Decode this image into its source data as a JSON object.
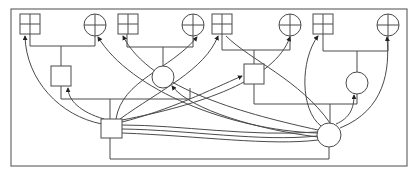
{
  "diagram": {
    "title": "",
    "colors": {
      "stroke": "#4a4a4a",
      "frame": "#6a6a6a",
      "arrow": "#222222",
      "background": "#ffffff"
    },
    "top_row": [
      {
        "id": "g1",
        "shape": "grid-square",
        "x": 22,
        "y": 14,
        "w": 20,
        "h": 20
      },
      {
        "id": "c1",
        "shape": "crossed-circle",
        "x": 95,
        "y": 25,
        "r": 11
      },
      {
        "id": "g2",
        "shape": "grid-square",
        "x": 119,
        "y": 14,
        "w": 20,
        "h": 20
      },
      {
        "id": "c2",
        "shape": "crossed-circle",
        "x": 193,
        "y": 25,
        "r": 11
      },
      {
        "id": "g3",
        "shape": "grid-square",
        "x": 212,
        "y": 14,
        "w": 20,
        "h": 20
      },
      {
        "id": "c3",
        "shape": "crossed-circle",
        "x": 290,
        "y": 25,
        "r": 11
      },
      {
        "id": "g4",
        "shape": "grid-square",
        "x": 313,
        "y": 14,
        "w": 20,
        "h": 20
      },
      {
        "id": "c4",
        "shape": "crossed-circle",
        "x": 388,
        "y": 25,
        "r": 11
      }
    ],
    "mid_row": [
      {
        "id": "s1",
        "shape": "square",
        "x": 51,
        "y": 66,
        "w": 20,
        "h": 20
      },
      {
        "id": "o1",
        "shape": "circle",
        "x": 163,
        "y": 77,
        "r": 11
      },
      {
        "id": "s2",
        "shape": "square",
        "x": 244,
        "y": 64,
        "w": 20,
        "h": 20
      },
      {
        "id": "o2",
        "shape": "circle",
        "x": 357,
        "y": 83,
        "r": 11
      }
    ],
    "hubs": [
      {
        "id": "hs",
        "shape": "square",
        "x": 102,
        "y": 119,
        "w": 20,
        "h": 19
      },
      {
        "id": "hc",
        "shape": "circle",
        "x": 329,
        "y": 135,
        "r": 12
      }
    ]
  }
}
